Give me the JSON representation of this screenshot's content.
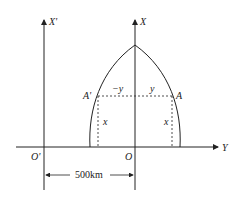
{
  "diagram": {
    "type": "coordinate-geometry",
    "labels": {
      "x_prime_axis": "X'",
      "x_axis": "X",
      "y_axis": "Y",
      "origin_prime": "O'",
      "origin": "O",
      "point_a": "A",
      "point_a_prime": "A'",
      "neg_y": "−y",
      "pos_y": "y",
      "x_left": "x",
      "x_right": "x",
      "distance": "500km"
    },
    "colors": {
      "line": "#222222",
      "background": "#ffffff"
    }
  }
}
